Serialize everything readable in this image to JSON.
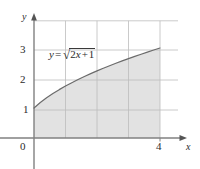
{
  "figure": {
    "kind": "cartesian-plot",
    "background_color": "#ffffff",
    "grid_color": "#b9b9b9",
    "axis_color": "#6e6e6e",
    "curve_color": "#6b6b6b",
    "shade_fill_color": "#e2e2e2",
    "text_color": "#2b2b2b"
  },
  "labels": {
    "axis_x": "x",
    "axis_y": "y",
    "origin": "0",
    "y_ticks": [
      "1",
      "2",
      "3"
    ],
    "x_ticks": [
      "4"
    ],
    "equation": {
      "full_text": "y = √(2x + 1)",
      "lhs": "y",
      "operator": "=",
      "radical_sign": "√",
      "radicand_coefficient": "2",
      "radicand_variable": "x",
      "radicand_plus": "+",
      "radicand_constant": "1"
    }
  },
  "chart_data": {
    "type": "line",
    "title": "",
    "subtitle": "",
    "xlabel": "x",
    "ylabel": "y",
    "xlim": [
      0,
      4.6
    ],
    "ylim": [
      0,
      3.6
    ],
    "grid": true,
    "grid_x_lines": [
      1,
      2,
      3,
      4
    ],
    "grid_y_lines": [
      1,
      2,
      3,
      3.6
    ],
    "x_tick_labels": [
      "0",
      "4"
    ],
    "x_tick_values": [
      0,
      4
    ],
    "y_tick_labels": [
      "1",
      "2",
      "3"
    ],
    "y_tick_values": [
      1,
      2,
      3
    ],
    "legend": null,
    "legend_position": "none",
    "annotations": [
      {
        "text": "y = √(2x + 1)",
        "x": 0.5,
        "y": 2.55
      }
    ],
    "series": [
      {
        "name": "y = sqrt(2x + 1)",
        "type": "line",
        "color": "#6b6b6b",
        "shaded_to_x_axis": true,
        "shade_color": "#e2e2e2",
        "shade_domain": [
          0,
          4
        ],
        "x": [
          0,
          0.2,
          0.4,
          0.6,
          0.8,
          1,
          1.2,
          1.4,
          1.6,
          1.8,
          2,
          2.2,
          2.4,
          2.6,
          2.8,
          3,
          3.2,
          3.4,
          3.6,
          3.8,
          4
        ],
        "values": [
          1,
          1.183,
          1.342,
          1.483,
          1.612,
          1.732,
          1.844,
          1.949,
          2.049,
          2.145,
          2.236,
          2.324,
          2.408,
          2.49,
          2.569,
          2.646,
          2.72,
          2.793,
          2.864,
          2.933,
          3
        ]
      }
    ],
    "endpoints": [
      {
        "label": "start",
        "x": 0,
        "y": 1
      },
      {
        "label": "end",
        "x": 4,
        "y": 3
      }
    ]
  }
}
